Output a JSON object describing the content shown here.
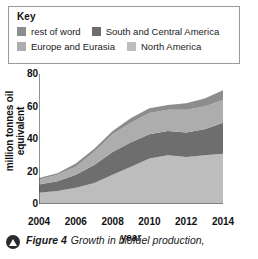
{
  "legend": {
    "title": "Key",
    "rows": [
      [
        {
          "label": "rest of word",
          "color": "#8d8d8d",
          "icon": "legend-swatch-icon"
        },
        {
          "label": "South and Central America",
          "color": "#6e6e6e",
          "icon": "legend-swatch-icon"
        }
      ],
      [
        {
          "label": "Europe and Eurasia",
          "color": "#adadad",
          "icon": "legend-swatch-icon"
        },
        {
          "label": "North America",
          "color": "#bdbdbd",
          "icon": "legend-swatch-icon"
        }
      ]
    ]
  },
  "caption": {
    "bullet_icon": "triangle-bullet-icon",
    "figure_number": "Figure 4",
    "text": "Growth in biofuel production,"
  },
  "chart_data": {
    "type": "area",
    "stacked": true,
    "title": "",
    "xlabel": "year",
    "ylabel": "million tonnes oil equivalent",
    "xlim": [
      2004,
      2014
    ],
    "ylim": [
      0,
      80
    ],
    "yticks": [
      0,
      20,
      40,
      60,
      80
    ],
    "xticks": [
      2004,
      2006,
      2008,
      2010,
      2012,
      2014
    ],
    "grid": false,
    "legend_position": "top",
    "x": [
      2004,
      2005,
      2006,
      2007,
      2008,
      2009,
      2010,
      2011,
      2012,
      2013,
      2014
    ],
    "series": [
      {
        "name": "North America",
        "color": "#bdbdbd",
        "values": [
          7,
          8,
          10,
          13,
          18,
          23,
          28,
          30,
          29,
          30,
          31
        ]
      },
      {
        "name": "South and Central America",
        "color": "#6e6e6e",
        "values": [
          5,
          6,
          8,
          11,
          14,
          15,
          15,
          15,
          15,
          16,
          19
        ]
      },
      {
        "name": "Europe and Eurasia",
        "color": "#adadad",
        "values": [
          3,
          4,
          5,
          8,
          11,
          12,
          13,
          13,
          14,
          14,
          14
        ]
      },
      {
        "name": "rest of word",
        "color": "#8d8d8d",
        "values": [
          1,
          1,
          2,
          2,
          2,
          3,
          3,
          3,
          4,
          5,
          6
        ]
      }
    ],
    "totals": [
      16,
      19,
      25,
      34,
      45,
      53,
      59,
      61,
      62,
      65,
      70
    ]
  }
}
